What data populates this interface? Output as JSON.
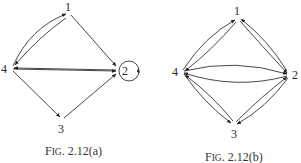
{
  "figures": [
    {
      "id": "a",
      "caption": "FIG. 2.12(a)",
      "nodes": [
        {
          "label": "1",
          "x": 69,
          "y": 12
        },
        {
          "label": "2",
          "x": 120,
          "y": 70
        },
        {
          "label": "3",
          "x": 62,
          "y": 120
        },
        {
          "label": "4",
          "x": 10,
          "y": 68
        }
      ],
      "edges": [
        {
          "from": "4",
          "to": "1",
          "curved": true
        },
        {
          "from": "1",
          "to": "4",
          "curved": true
        },
        {
          "from": "1",
          "to": "2"
        },
        {
          "from": "4",
          "to": "2"
        },
        {
          "from": "2",
          "to": "4"
        },
        {
          "from": "4",
          "to": "3"
        },
        {
          "from": "3",
          "to": "2"
        },
        {
          "from": "2",
          "to": "2",
          "loop": true
        }
      ]
    },
    {
      "id": "b",
      "caption": "FIG. 2.12(b)",
      "nodes": [
        {
          "label": "1",
          "x": 238,
          "y": 18
        },
        {
          "label": "2",
          "x": 290,
          "y": 75
        },
        {
          "label": "3",
          "x": 234,
          "y": 125
        },
        {
          "label": "4",
          "x": 181,
          "y": 72
        }
      ],
      "edges": [
        {
          "from": "4",
          "to": "1"
        },
        {
          "from": "1",
          "to": "4"
        },
        {
          "from": "1",
          "to": "2"
        },
        {
          "from": "2",
          "to": "1"
        },
        {
          "from": "4",
          "to": "2"
        },
        {
          "from": "2",
          "to": "4"
        },
        {
          "from": "4",
          "to": "3"
        },
        {
          "from": "3",
          "to": "4"
        },
        {
          "from": "3",
          "to": "2"
        },
        {
          "from": "2",
          "to": "3"
        }
      ]
    }
  ]
}
